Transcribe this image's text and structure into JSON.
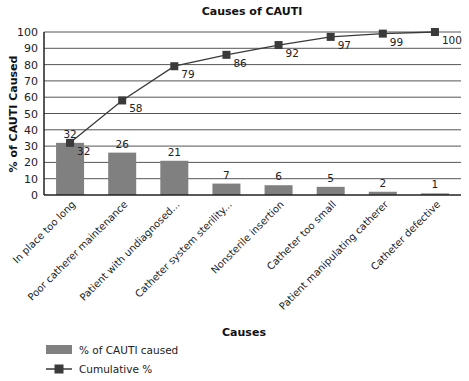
{
  "chart_data": {
    "type": "bar",
    "title": "Causes of CAUTI",
    "xlabel": "Causes",
    "ylabel": "% of CAUTI Caused",
    "ylim": [
      0,
      100
    ],
    "yticks": [
      0,
      10,
      20,
      30,
      40,
      50,
      60,
      70,
      80,
      90,
      100
    ],
    "grid": true,
    "legend_position": "bottom-left",
    "categories": [
      "In place too long",
      "Poor catherer maintenance",
      "Patient with undiagnosed...",
      "Catheter system sterility...",
      "Nonsterile insertion",
      "Catheter too small",
      "Patient manipulating catherer",
      "Catheter defective"
    ],
    "series": [
      {
        "name": "% of CAUTI caused",
        "type": "bar",
        "color": "#808080",
        "values": [
          32,
          26,
          21,
          7,
          6,
          5,
          2,
          1
        ]
      },
      {
        "name": "Cumulative %",
        "type": "line",
        "color": "#3a3a3a",
        "marker": "square",
        "values": [
          32,
          58,
          79,
          86,
          92,
          97,
          99,
          100
        ]
      }
    ]
  }
}
